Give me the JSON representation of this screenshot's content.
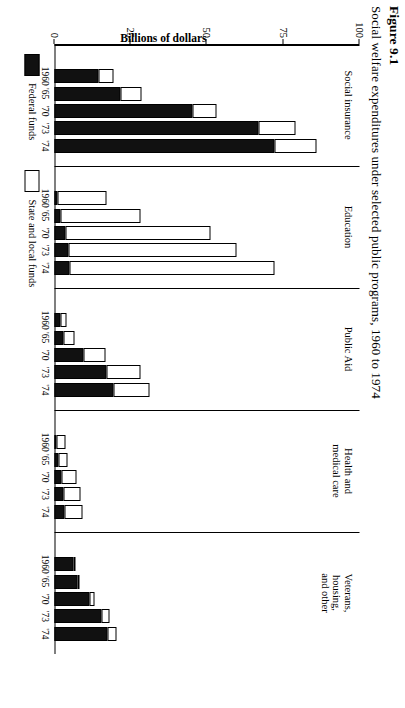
{
  "figure": {
    "number": "Figure 9.1",
    "caption": "Social welfare expenditures under selected public programs, 1960 to 1974"
  },
  "axis": {
    "title": "Billions of dollars",
    "ticks": [
      "0",
      "25",
      "50",
      "75",
      "100"
    ],
    "min": 0,
    "max": 100
  },
  "legend": {
    "federal": "Federal funds",
    "state_local": "State and local funds"
  },
  "categories": [
    "Social insurance",
    "Education",
    "Public Aid",
    "Health and\nmedical care",
    "Veterans,\nhousing,\nand other"
  ],
  "years": [
    "1960",
    "'65",
    "'70",
    "'73",
    "'74"
  ],
  "chart_data": {
    "type": "bar",
    "title": "Social welfare expenditures under selected public programs, 1960 to 1974",
    "xlabel": "",
    "ylabel": "Billions of dollars",
    "ylim": [
      0,
      100
    ],
    "grid": false,
    "legend_position": "bottom-left",
    "stacked": true,
    "groups": [
      "Social insurance",
      "Education",
      "Public Aid",
      "Health and medical care",
      "Veterans, housing, and other"
    ],
    "categories": [
      "1960",
      "'65",
      "'70",
      "'73",
      "'74"
    ],
    "series": [
      {
        "name": "Federal funds",
        "color": "#111111",
        "values": {
          "Social insurance": [
            14.3,
            21.8,
            45.2,
            67.0,
            72.0
          ],
          "Education": [
            1.1,
            2.0,
            3.5,
            4.6,
            5.0
          ],
          "Public Aid": [
            2.1,
            3.1,
            9.6,
            17.1,
            19.5
          ],
          "Health and medical care": [
            0.7,
            1.2,
            2.3,
            3.0,
            3.3
          ],
          "Veterans, housing, and other": [
            6.3,
            7.5,
            11.5,
            15.5,
            17.4
          ]
        }
      },
      {
        "name": "State and local funds",
        "color": "#ffffff",
        "values": {
          "Social insurance": [
            5.0,
            6.7,
            8.0,
            12.0,
            14.0
          ],
          "Education": [
            16.0,
            26.2,
            47.8,
            55.0,
            67.0
          ],
          "Public Aid": [
            1.9,
            3.3,
            7.1,
            11.0,
            11.5
          ],
          "Health and medical care": [
            3.0,
            3.2,
            4.8,
            5.4,
            6.0
          ],
          "Veterans, housing, and other": [
            0.4,
            0.6,
            1.5,
            2.5,
            2.8
          ]
        }
      }
    ],
    "totals": {
      "Social insurance": [
        19.3,
        28.5,
        53.2,
        79.0,
        86.0
      ],
      "Education": [
        17.1,
        28.2,
        51.3,
        59.6,
        72.0
      ],
      "Public Aid": [
        4.0,
        6.4,
        16.7,
        28.1,
        31.0
      ],
      "Health and medical care": [
        3.7,
        4.4,
        7.1,
        8.4,
        9.3
      ],
      "Veterans, housing, and other": [
        6.7,
        8.1,
        13.0,
        18.0,
        20.2
      ]
    }
  }
}
